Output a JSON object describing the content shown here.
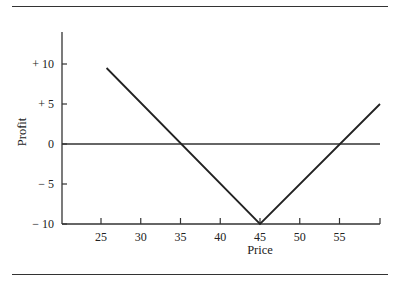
{
  "chart_data": {
    "type": "line",
    "title": "",
    "xlabel": "Price",
    "ylabel": "Profit",
    "xlim": [
      20,
      60
    ],
    "ylim": [
      -10,
      15
    ],
    "x_ticks": [
      25,
      30,
      35,
      40,
      45,
      50,
      55,
      60
    ],
    "x_tick_labels": [
      "25",
      "30",
      "35",
      "40",
      "45",
      "50",
      "55",
      ""
    ],
    "y_ticks": [
      10,
      5,
      0,
      -5,
      -10
    ],
    "y_tick_labels": [
      "+ 10",
      "+ 5",
      "0",
      "− 5",
      "− 10"
    ],
    "grid": false,
    "legend": null,
    "zero_line": true,
    "series": [
      {
        "name": "Profit",
        "x": [
          25.7,
          45,
          60
        ],
        "y": [
          9.5,
          -10,
          5
        ]
      }
    ],
    "breakeven_points": [
      35.3,
      55.3
    ],
    "min_profit": {
      "price": 45,
      "profit": -10
    }
  }
}
